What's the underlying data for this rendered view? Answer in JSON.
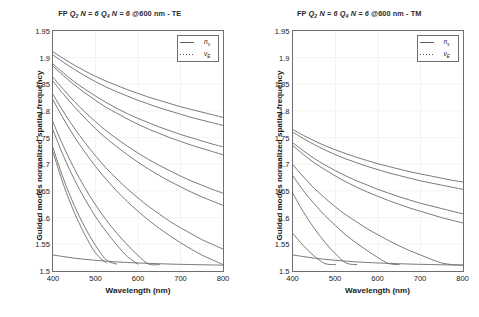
{
  "figure": {
    "background": "#ffffff",
    "curve_color": "#6b6b6b",
    "axis_color": "#6e6e6e",
    "grid_color": "#ededed"
  },
  "panels": [
    {
      "id": "te",
      "title_text": "FP Q2 N = 6 Q4 N = 6 @600 nm - TE",
      "title_parts": {
        "fp": "FP ",
        "q2": "Q",
        "q2_sub": "2",
        "n1": " N = 6 ",
        "q4": "Q",
        "q4_sub": "4",
        "n2": " N = 6 ",
        "tail": "@600 nm - TE"
      },
      "legend": {
        "entries": [
          {
            "label": "n",
            "sub": "s",
            "style": "solid",
            "name": "substrate-index"
          },
          {
            "label": "ν",
            "sub": "E",
            "style": "dotted",
            "name": "effective-frequency"
          }
        ]
      }
    },
    {
      "id": "tm",
      "title_text": "FP Q2 N = 6 Q4 N = 6 @600 nm - TM",
      "title_parts": {
        "fp": "FP ",
        "q2": "Q",
        "q2_sub": "2",
        "n1": " N = 6 ",
        "q4": "Q",
        "q4_sub": "4",
        "n2": " N = 6 ",
        "tail": "@600 nm - TM"
      },
      "legend": {
        "entries": [
          {
            "label": "n",
            "sub": "s",
            "style": "solid",
            "name": "substrate-index"
          },
          {
            "label": "ν",
            "sub": "E",
            "style": "dotted",
            "name": "effective-frequency"
          }
        ]
      }
    }
  ],
  "chart_data": [
    {
      "type": "line",
      "id": "te",
      "title": "FP Q2 N = 6 Q4 N = 6 @600 nm - TE",
      "xlabel": "Wavelength (nm)",
      "ylabel": "Guided modes normalized spatial frequency",
      "xlim": [
        400,
        800
      ],
      "ylim": [
        1.5,
        1.95
      ],
      "xticks": [
        400,
        500,
        600,
        700,
        800
      ],
      "yticks": [
        1.5,
        1.55,
        1.6,
        1.65,
        1.7,
        1.75,
        1.8,
        1.85,
        1.9,
        1.95
      ],
      "grid": true,
      "legend_position": "top-right",
      "x": [
        400,
        425,
        450,
        475,
        500,
        525,
        550,
        575,
        600,
        625,
        650,
        675,
        700,
        725,
        750,
        775,
        800
      ],
      "series": [
        {
          "name": "substrate index n_s",
          "style": "solid",
          "values": [
            1.53,
            1.527,
            1.524,
            1.522,
            1.52,
            1.5185,
            1.517,
            1.516,
            1.515,
            1.5143,
            1.5136,
            1.513,
            1.5125,
            1.5121,
            1.5117,
            1.5113,
            1.511
          ]
        },
        {
          "name": "mode 1",
          "style": "solid",
          "values": [
            1.911,
            1.898,
            1.886,
            1.875,
            1.865,
            1.856,
            1.848,
            1.84,
            1.833,
            1.826,
            1.82,
            1.814,
            1.808,
            1.803,
            1.798,
            1.793,
            1.788
          ]
        },
        {
          "name": "mode 2",
          "style": "solid",
          "values": [
            1.905,
            1.891,
            1.878,
            1.866,
            1.855,
            1.845,
            1.836,
            1.828,
            1.82,
            1.813,
            1.806,
            1.8,
            1.794,
            1.788,
            1.783,
            1.778,
            1.773
          ]
        },
        {
          "name": "mode 3",
          "style": "solid",
          "values": [
            1.888,
            1.871,
            1.855,
            1.841,
            1.828,
            1.816,
            1.805,
            1.795,
            1.786,
            1.778,
            1.77,
            1.763,
            1.756,
            1.75,
            1.744,
            1.738,
            1.733
          ]
        },
        {
          "name": "mode 4",
          "style": "solid",
          "values": [
            1.884,
            1.866,
            1.849,
            1.834,
            1.82,
            1.807,
            1.796,
            1.785,
            1.775,
            1.766,
            1.758,
            1.75,
            1.743,
            1.736,
            1.73,
            1.724,
            1.718
          ]
        },
        {
          "name": "mode 5",
          "style": "solid",
          "values": [
            1.863,
            1.84,
            1.818,
            1.798,
            1.78,
            1.763,
            1.748,
            1.734,
            1.721,
            1.709,
            1.698,
            1.688,
            1.678,
            1.669,
            1.661,
            1.653,
            1.646
          ]
        },
        {
          "name": "mode 6",
          "style": "solid",
          "values": [
            1.856,
            1.831,
            1.808,
            1.787,
            1.767,
            1.749,
            1.733,
            1.718,
            1.704,
            1.691,
            1.679,
            1.668,
            1.658,
            1.648,
            1.639,
            1.631,
            1.623
          ]
        },
        {
          "name": "mode 7",
          "style": "solid",
          "values": [
            1.831,
            1.798,
            1.768,
            1.741,
            1.716,
            1.693,
            1.673,
            1.654,
            1.637,
            1.621,
            1.607,
            1.593,
            1.581,
            1.57,
            1.559,
            1.55,
            1.541
          ]
        },
        {
          "name": "mode 8",
          "style": "solid",
          "values": [
            1.821,
            1.785,
            1.752,
            1.723,
            1.696,
            1.672,
            1.65,
            1.63,
            1.612,
            1.595,
            1.58,
            1.566,
            1.553,
            1.541,
            1.53,
            1.521,
            1.512
          ]
        },
        {
          "name": "mode 9",
          "style": "solid",
          "values": [
            1.779,
            1.733,
            1.692,
            1.656,
            1.624,
            1.596,
            1.571,
            1.549,
            1.529,
            1.513,
            1.512,
            null,
            null,
            null,
            null,
            null,
            null
          ]
        },
        {
          "name": "mode 10",
          "style": "solid",
          "values": [
            1.764,
            1.715,
            1.672,
            1.635,
            1.602,
            1.574,
            1.549,
            1.527,
            1.513,
            null,
            null,
            null,
            null,
            null,
            null,
            null,
            null
          ]
        },
        {
          "name": "mode 11",
          "style": "solid",
          "values": [
            1.731,
            1.672,
            1.623,
            1.582,
            1.548,
            1.521,
            1.513,
            null,
            null,
            null,
            null,
            null,
            null,
            null,
            null,
            null,
            null
          ]
        },
        {
          "name": "mode 12",
          "style": "solid",
          "values": [
            1.723,
            1.661,
            1.61,
            1.568,
            1.534,
            1.515,
            null,
            null,
            null,
            null,
            null,
            null,
            null,
            null,
            null,
            null,
            null
          ]
        }
      ]
    },
    {
      "type": "line",
      "id": "tm",
      "title": "FP Q2 N = 6 Q4 N = 6 @600 nm - TM",
      "xlabel": "Wavelength (nm)",
      "ylabel": "Guided modes normalized spatial frequency",
      "xlim": [
        400,
        800
      ],
      "ylim": [
        1.5,
        1.95
      ],
      "xticks": [
        400,
        500,
        600,
        700,
        800
      ],
      "yticks": [
        1.5,
        1.55,
        1.6,
        1.65,
        1.7,
        1.75,
        1.8,
        1.85,
        1.9,
        1.95
      ],
      "grid": true,
      "legend_position": "top-right",
      "x": [
        400,
        425,
        450,
        475,
        500,
        525,
        550,
        575,
        600,
        625,
        650,
        675,
        700,
        725,
        750,
        775,
        800
      ],
      "series": [
        {
          "name": "substrate index n_s",
          "style": "solid",
          "values": [
            1.53,
            1.527,
            1.524,
            1.522,
            1.52,
            1.5185,
            1.517,
            1.516,
            1.515,
            1.5143,
            1.5136,
            1.513,
            1.5125,
            1.5121,
            1.5117,
            1.5113,
            1.511
          ]
        },
        {
          "name": "mode 1",
          "style": "solid",
          "values": [
            1.765,
            1.754,
            1.744,
            1.735,
            1.727,
            1.72,
            1.713,
            1.707,
            1.701,
            1.696,
            1.691,
            1.686,
            1.682,
            1.678,
            1.674,
            1.67,
            1.667
          ]
        },
        {
          "name": "mode 2",
          "style": "solid",
          "values": [
            1.76,
            1.748,
            1.737,
            1.727,
            1.718,
            1.71,
            1.703,
            1.696,
            1.69,
            1.684,
            1.679,
            1.674,
            1.669,
            1.665,
            1.661,
            1.657,
            1.653
          ]
        },
        {
          "name": "mode 3",
          "style": "solid",
          "values": [
            1.74,
            1.725,
            1.711,
            1.699,
            1.688,
            1.678,
            1.669,
            1.661,
            1.653,
            1.646,
            1.639,
            1.633,
            1.627,
            1.622,
            1.617,
            1.612,
            1.607
          ]
        },
        {
          "name": "mode 4",
          "style": "solid",
          "values": [
            1.735,
            1.718,
            1.703,
            1.69,
            1.678,
            1.667,
            1.657,
            1.648,
            1.64,
            1.632,
            1.625,
            1.618,
            1.612,
            1.606,
            1.6,
            1.595,
            1.59
          ]
        },
        {
          "name": "mode 5",
          "style": "solid",
          "values": [
            1.699,
            1.676,
            1.655,
            1.637,
            1.62,
            1.605,
            1.592,
            1.579,
            1.568,
            1.557,
            1.547,
            1.538,
            1.53,
            1.522,
            1.515,
            1.512,
            1.511
          ]
        },
        {
          "name": "mode 6",
          "style": "solid",
          "values": [
            1.678,
            1.65,
            1.626,
            1.604,
            1.585,
            1.567,
            1.552,
            1.538,
            1.525,
            1.514,
            1.512,
            null,
            null,
            null,
            null,
            null,
            null
          ]
        },
        {
          "name": "mode 7",
          "style": "solid",
          "values": [
            1.645,
            1.61,
            1.58,
            1.554,
            1.532,
            1.515,
            1.512,
            null,
            null,
            null,
            null,
            null,
            null,
            null,
            null,
            null,
            null
          ]
        },
        {
          "name": "mode 8",
          "style": "solid",
          "values": [
            1.57,
            1.547,
            1.528,
            1.514,
            1.512,
            null,
            null,
            null,
            null,
            null,
            null,
            null,
            null,
            null,
            null,
            null,
            null
          ]
        }
      ]
    }
  ]
}
